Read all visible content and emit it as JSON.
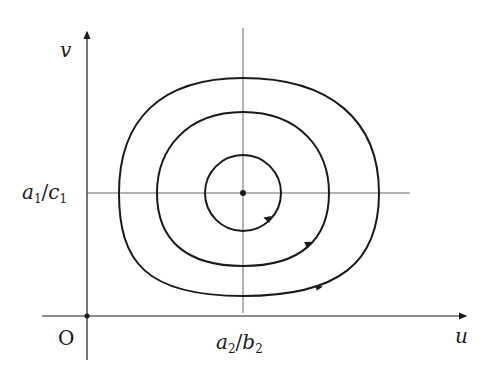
{
  "diagram": {
    "type": "phase-portrait",
    "axes": {
      "x_label": "u",
      "y_label": "v",
      "origin_label": "O"
    },
    "equilibrium": {
      "x_tick": {
        "base": "a",
        "sub1": "2",
        "slash": "/",
        "base2": "b",
        "sub2": "2"
      },
      "y_tick": {
        "base": "a",
        "sub1": "1",
        "slash": "/",
        "base2": "c",
        "sub2": "1"
      }
    },
    "orbits": [
      {
        "name": "inner",
        "rx": 38,
        "ry": 38
      },
      {
        "name": "middle",
        "rx": 86,
        "ry": 77
      },
      {
        "name": "outer",
        "rx": 130,
        "ry": 109
      }
    ],
    "colors": {
      "stroke": "#1a1a1a",
      "guide": "#555555"
    }
  }
}
